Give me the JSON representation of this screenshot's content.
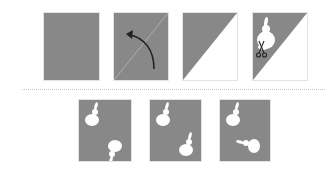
{
  "figure": {
    "colors": {
      "paper": "#888888",
      "cut": "#ffffff",
      "arrow": "#222222",
      "divider": "#c4c4c4"
    },
    "steps": [
      {
        "id": "step-1",
        "label": "unfolded square paper"
      },
      {
        "id": "step-2",
        "label": "fold along diagonal",
        "icon": "curved-arrow-icon"
      },
      {
        "id": "step-3",
        "label": "folded triangle"
      },
      {
        "id": "step-4",
        "label": "cut rabbit shape",
        "icon": "scissors-icon"
      }
    ],
    "options": [
      {
        "id": "option-a",
        "label": "two rabbits, lower one inverted"
      },
      {
        "id": "option-b",
        "label": "two upright rabbits"
      },
      {
        "id": "option-c",
        "label": "two rabbits, lower one rotated sideways"
      }
    ]
  }
}
